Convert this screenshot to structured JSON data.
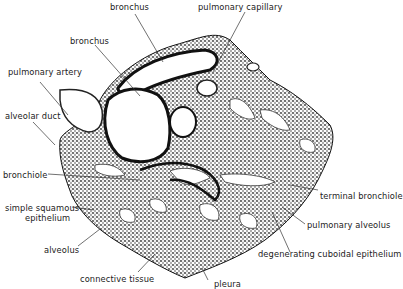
{
  "figure": {
    "labels": {
      "bronchus_top": "bronchus",
      "pulmonary_capillary": "pulmonary capillary",
      "bronchus_left": "bronchus",
      "pulmonary_artery": "pulmonary artery",
      "alveolar_duct": "alveolar duct",
      "bronchiole": "bronchiole",
      "simple_squamous_1": "simple squamous",
      "simple_squamous_2": "epithelium",
      "alveolus": "alveolus",
      "connective_tissue": "connective tissue",
      "pleura": "pleura",
      "terminal_bronchiole": "terminal bronchiole",
      "pulmonary_alveolus": "pulmonary alveolus",
      "degenerating_cuboidal": "degenerating cuboidal epithelium"
    }
  }
}
